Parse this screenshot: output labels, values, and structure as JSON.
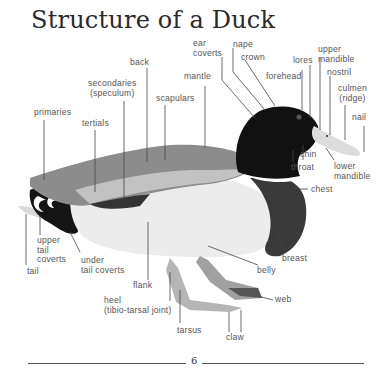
{
  "title": "Structure of a Duck",
  "page_number": "6",
  "labels": {
    "ear_coverts_1": "ear",
    "ear_coverts_2": "coverts",
    "nape": "nape",
    "crown": "crown",
    "lores": "lores",
    "upper_mandible_1": "upper",
    "upper_mandible_2": "mandible",
    "forehead": "forehead",
    "nostril": "nostril",
    "culmen_1": "culmen",
    "culmen_2": "(ridge)",
    "nail": "nail",
    "back": "back",
    "secondaries_1": "secondaries",
    "secondaries_2": "(speculum)",
    "mantle": "mantle",
    "scapulars": "scapulars",
    "primaries": "primaries",
    "tertials": "tertials",
    "chin": "chin",
    "throat": "throat",
    "lower_mandible_1": "lower",
    "lower_mandible_2": "mandible",
    "chest": "chest",
    "upper_tail_coverts_1": "upper",
    "upper_tail_coverts_2": "tail",
    "upper_tail_coverts_3": "coverts",
    "under_tail_coverts_1": "under",
    "under_tail_coverts_2": "tail coverts",
    "tail": "tail",
    "flank": "flank",
    "breast": "breast",
    "belly": "belly",
    "web": "web",
    "heel_1": "heel",
    "heel_2": "(tibio-tarsal joint)",
    "tarsus": "tarsus",
    "claw": "claw"
  },
  "colors": {
    "head": "#111111",
    "body_white": "#eeeeee",
    "wing": "#8a8a8a",
    "breast": "#3a3a3a",
    "bill": "#dcdcdc",
    "legs": "#b5b5b5",
    "leader_line": "#444444"
  }
}
